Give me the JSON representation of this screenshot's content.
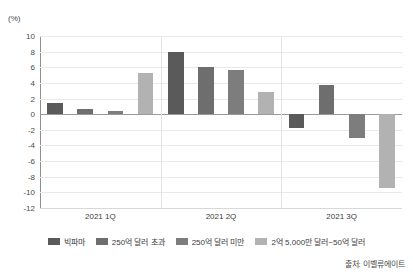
{
  "chart_data": {
    "type": "bar",
    "title": "",
    "subtitle": "",
    "xlabel": "",
    "ylabel": "(%)",
    "unit_label": "(%)",
    "categories": [
      "2021 1Q",
      "2021 2Q",
      "2021 3Q"
    ],
    "series": [
      {
        "name": "빅파마",
        "color": "#5a5a5a",
        "values": [
          1.4,
          7.9,
          -1.8
        ]
      },
      {
        "name": "250억 달러 초과",
        "color": "#6e6e6e",
        "values": [
          0.7,
          6.0,
          3.7
        ]
      },
      {
        "name": "250억 달러 미만",
        "color": "#7d7d7d",
        "values": [
          0.4,
          5.7,
          -3.0
        ]
      },
      {
        "name": "2억 5,000만 달러~50억 달러",
        "color": "#b2b2b2",
        "values": [
          5.3,
          2.9,
          -9.4
        ]
      }
    ],
    "ylim": [
      -12,
      10
    ],
    "ytick_step": 2,
    "yticks": [
      10,
      8,
      6,
      4,
      2,
      0,
      -2,
      -4,
      -6,
      -8,
      -10,
      -12
    ],
    "ytick_labels": [
      "10",
      "8",
      "6",
      "4",
      "2",
      "0",
      "-2",
      "-4",
      "-6",
      "-8",
      "-10",
      "-12"
    ],
    "grid": true,
    "legend_position": "bottom",
    "zero_line": true
  },
  "source": {
    "text": "출처: 이벨류에이트"
  }
}
